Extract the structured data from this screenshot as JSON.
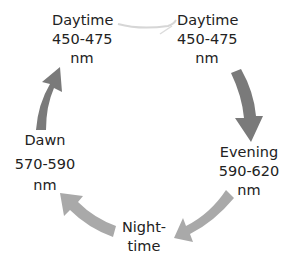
{
  "diagram": {
    "type": "cycle",
    "nodes": [
      {
        "id": "daytime-left",
        "lines": [
          "Daytime",
          "450-475",
          "nm"
        ]
      },
      {
        "id": "daytime-right",
        "lines": [
          "Daytime",
          "450-475",
          "nm"
        ]
      },
      {
        "id": "evening",
        "lines": [
          "Evening",
          "590-620",
          "nm"
        ]
      },
      {
        "id": "nighttime",
        "lines": [
          "Night-",
          "time"
        ]
      },
      {
        "id": "dawn",
        "lines": [
          "Dawn",
          "570-590",
          "nm"
        ]
      }
    ],
    "edges": [
      {
        "from": "daytime-left",
        "to": "daytime-right",
        "style": "faint-line"
      },
      {
        "from": "daytime-right",
        "to": "evening",
        "style": "dark-arrow"
      },
      {
        "from": "evening",
        "to": "nighttime",
        "style": "light-arrow"
      },
      {
        "from": "nighttime",
        "to": "dawn",
        "style": "light-arrow"
      },
      {
        "from": "dawn",
        "to": "daytime-left",
        "style": "dark-arrow"
      }
    ],
    "colors": {
      "dark_arrow": "#7a7a7a",
      "light_arrow": "#a9a9a9",
      "faint_line": "#d6d6d6",
      "text": "#222222"
    }
  }
}
